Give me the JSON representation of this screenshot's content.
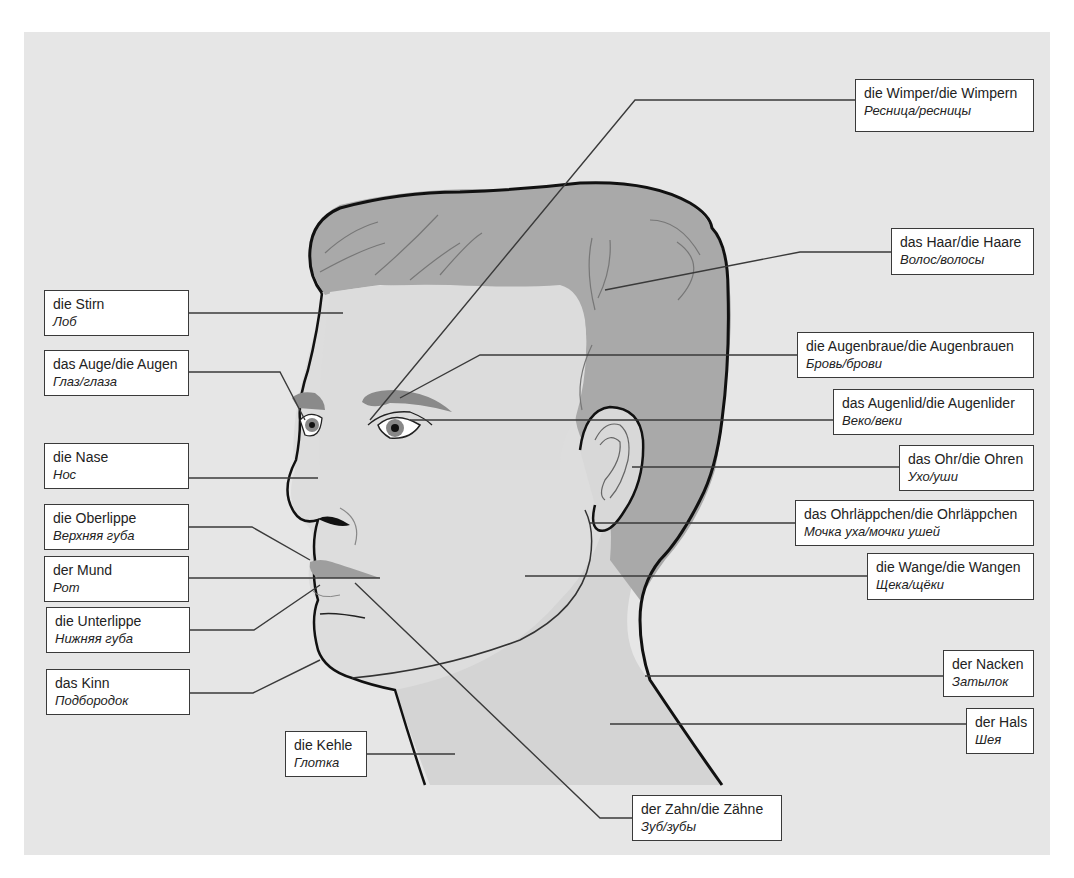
{
  "title": "",
  "colors": {
    "background": "#e6e6e6",
    "skin": "#dcdcdc",
    "hair": "#a7a7a7",
    "outline": "#111111",
    "leader_line": "#3a3a3a",
    "label_fill": "#ffffff",
    "label_border": "#3a3a3a"
  },
  "labels": [
    {
      "id": "stirn",
      "de": "die Stirn",
      "ru": "Лоб",
      "side": "left"
    },
    {
      "id": "auge",
      "de": "das Auge/die Augen",
      "ru": "Глаз/глаза",
      "side": "left"
    },
    {
      "id": "nase",
      "de": "die Nase",
      "ru": "Нос",
      "side": "left"
    },
    {
      "id": "oberlippe",
      "de": "die Oberlippe",
      "ru": "Верхняя губа",
      "side": "left"
    },
    {
      "id": "mund",
      "de": "der Mund",
      "ru": "Рот",
      "side": "left"
    },
    {
      "id": "unterlippe",
      "de": "die Unterlippe",
      "ru": "Нижняя губа",
      "side": "left"
    },
    {
      "id": "kinn",
      "de": "das Kinn",
      "ru": "Подбородок",
      "side": "left"
    },
    {
      "id": "kehle",
      "de": "die Kehle",
      "ru": "Глотка",
      "side": "bottom"
    },
    {
      "id": "zahn",
      "de": "der Zahn/die Zähne",
      "ru": "Зуб/зубы",
      "side": "bottom"
    },
    {
      "id": "wimper",
      "de": "die Wimper/die Wimpern",
      "ru": "Ресница/ресницы",
      "side": "right"
    },
    {
      "id": "haar",
      "de": "das Haar/die Haare",
      "ru": "Волос/волосы",
      "side": "right"
    },
    {
      "id": "augenbraue",
      "de": "die Augenbraue/die Augenbrauen",
      "ru": "Бровь/брови",
      "side": "right"
    },
    {
      "id": "augenlid",
      "de": "das Augenlid/die Augenlider",
      "ru": "Веко/веки",
      "side": "right"
    },
    {
      "id": "ohr",
      "de": "das Ohr/die Ohren",
      "ru": "Ухо/уши",
      "side": "right"
    },
    {
      "id": "ohrlaeppchen",
      "de": "das Ohrläppchen/die Ohrläppchen",
      "ru": "Мочка уха/мочки ушей",
      "side": "right"
    },
    {
      "id": "wange",
      "de": "die Wange/die Wangen",
      "ru": "Щека/щёки",
      "side": "right"
    },
    {
      "id": "nacken",
      "de": "der Nacken",
      "ru": "Затылок",
      "side": "right"
    },
    {
      "id": "hals",
      "de": "der Hals",
      "ru": "Шея",
      "side": "right"
    }
  ]
}
